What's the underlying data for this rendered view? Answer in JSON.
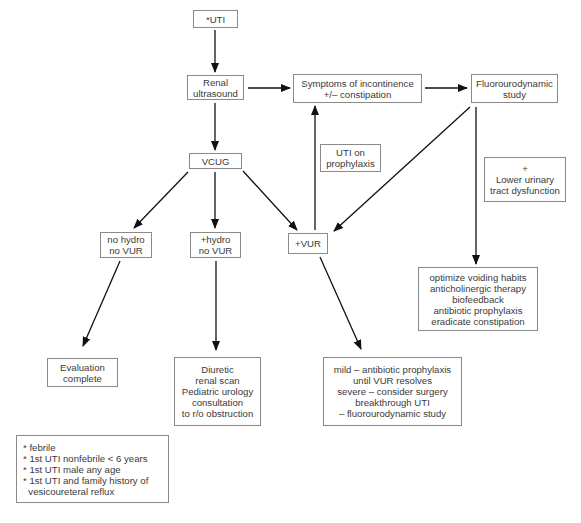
{
  "diagram": {
    "type": "flowchart",
    "colors": {
      "line": "#111111",
      "box_border": "#8a8a8a",
      "text": "#3a3a3a",
      "background": "#ffffff"
    },
    "nodes": {
      "uti": {
        "lines": [
          "*UTI"
        ]
      },
      "renal_ultrasound": {
        "lines": [
          "Renal",
          "ultrasound"
        ]
      },
      "symptoms": {
        "lines": [
          "Symptoms of incontinence",
          "+/– constipation"
        ]
      },
      "fluorourodynamic": {
        "lines": [
          "Fluorourodynamic",
          "study"
        ]
      },
      "uti_prophylaxis": {
        "lines": [
          "UTI on",
          "prophylaxis"
        ]
      },
      "lower_urinary": {
        "lines": [
          "+",
          "Lower urinary",
          "tract dysfunction"
        ]
      },
      "vcug": {
        "lines": [
          "VCUG"
        ]
      },
      "no_hydro": {
        "lines": [
          "no hydro",
          "no VUR"
        ]
      },
      "plus_hydro": {
        "lines": [
          "+hydro",
          "no VUR"
        ]
      },
      "plus_vur": {
        "lines": [
          "+VUR"
        ]
      },
      "optimize": {
        "lines": [
          "optimize voiding habits",
          "anticholinergic therapy",
          "biofeedback",
          "antibiotic prophylaxis",
          "eradicate constipation"
        ]
      },
      "evaluation_complete": {
        "lines": [
          "Evaluation",
          "complete"
        ]
      },
      "diuretic": {
        "lines": [
          "Diuretic",
          "renal scan",
          "Pediatric urology",
          "consultation",
          "to r/o obstruction"
        ]
      },
      "mild": {
        "lines": [
          "mild – antibiotic prophylaxis",
          "until VUR resolves",
          "severe – consider surgery",
          "breakthrough UTI",
          "– fluorourodynamic study"
        ]
      },
      "footnote": {
        "lines": [
          "* febrile",
          "* 1st UTI nonfebrile < 6 years",
          "* 1st UTI male any age",
          "* 1st UTI and family history of",
          "  vesicoureteral reflux"
        ]
      }
    },
    "edges": [
      {
        "from": "uti",
        "to": "renal_ultrasound"
      },
      {
        "from": "renal_ultrasound",
        "to": "symptoms"
      },
      {
        "from": "symptoms",
        "to": "fluorourodynamic"
      },
      {
        "from": "renal_ultrasound",
        "to": "vcug"
      },
      {
        "from": "vcug",
        "to": "no_hydro"
      },
      {
        "from": "vcug",
        "to": "plus_hydro"
      },
      {
        "from": "vcug",
        "to": "plus_vur"
      },
      {
        "from": "plus_vur",
        "to": "symptoms",
        "label": "UTI on prophylaxis"
      },
      {
        "from": "fluorourodynamic",
        "to": "plus_vur"
      },
      {
        "from": "fluorourodynamic",
        "to": "optimize",
        "label": "+ Lower urinary tract dysfunction"
      },
      {
        "from": "no_hydro",
        "to": "evaluation_complete"
      },
      {
        "from": "plus_hydro",
        "to": "diuretic"
      },
      {
        "from": "plus_vur",
        "to": "mild"
      }
    ]
  }
}
